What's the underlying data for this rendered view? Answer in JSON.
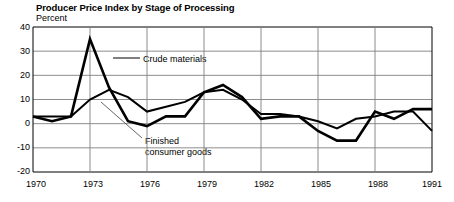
{
  "chart_data": {
    "type": "line",
    "title": "Producer Price Index by Stage of Processing",
    "subtitle": "Percent",
    "ylabel": "Percent",
    "xlabel": "",
    "ylim": [
      -20,
      40
    ],
    "xlim": [
      1970,
      1991
    ],
    "grid": true,
    "legend_position": "inline-annotations",
    "ytick_labels": [
      "40",
      "30",
      "20",
      "10",
      "0",
      "-10",
      "-20"
    ],
    "ytick_values": [
      40,
      30,
      20,
      10,
      0,
      -10,
      -20
    ],
    "xtick_labels": [
      "1970",
      "1973",
      "1976",
      "1979",
      "1982",
      "1985",
      "1988",
      "1991"
    ],
    "xtick_values": [
      1970,
      1973,
      1976,
      1979,
      1982,
      1985,
      1988,
      1991
    ],
    "x": [
      1970,
      1971,
      1972,
      1973,
      1974,
      1975,
      1976,
      1977,
      1978,
      1979,
      1980,
      1981,
      1982,
      1983,
      1984,
      1985,
      1986,
      1987,
      1988,
      1989,
      1990,
      1991
    ],
    "series": [
      {
        "name": "Crude materials",
        "values": [
          3,
          1,
          3,
          35,
          15,
          1,
          -1,
          3,
          3,
          13,
          16,
          11,
          2,
          3,
          3,
          -3,
          -7,
          -7,
          5,
          2,
          6,
          6
        ]
      },
      {
        "name": "Finished consumer goods",
        "values": [
          3,
          3,
          3,
          10,
          14,
          11,
          5,
          7,
          9,
          13,
          14,
          10,
          4,
          4,
          3,
          1,
          -2,
          2,
          3,
          5,
          5,
          -3
        ]
      }
    ],
    "annotations": [
      {
        "label": "Crude materials",
        "x": 1974,
        "y": 26
      },
      {
        "label": "Finished consumer goods",
        "x": 1976,
        "y": -9
      }
    ]
  },
  "annotation_text": {
    "crude": "Crude materials",
    "finished_line1": "Finished",
    "finished_line2": "consumer goods"
  },
  "colors": {
    "series_line": "#000000",
    "grid": "#808080",
    "axis": "#000000",
    "background": "#ffffff",
    "leader": "#555555"
  }
}
